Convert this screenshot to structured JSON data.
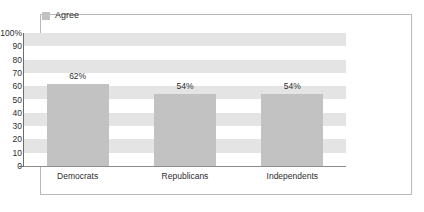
{
  "headline": {
    "text": "DATA: REGARDLESS OF PARTY AFFILIATION"
  },
  "legend": {
    "position": "top-left",
    "entries": [
      {
        "label": "Agree",
        "color": "#c2c2c2",
        "swatch_name": "legend-swatch-agree"
      }
    ]
  },
  "chart_data": {
    "type": "bar",
    "title": "",
    "xlabel": "",
    "ylabel": "",
    "categories": [
      "Democrats",
      "Republicans",
      "Independents"
    ],
    "series": [
      {
        "name": "Agree",
        "values": [
          62,
          54,
          54
        ],
        "color": "#c2c2c2"
      }
    ],
    "values": [
      62,
      54,
      54
    ],
    "value_labels": [
      "62%",
      "54%",
      "54%"
    ],
    "ylim": [
      0,
      100
    ],
    "ytick_step": 10,
    "ytick_labels": [
      "100%",
      "90",
      "80",
      "70",
      "60",
      "50",
      "40",
      "30",
      "20",
      "10",
      "0"
    ],
    "ytick_values": [
      100,
      90,
      80,
      70,
      60,
      50,
      40,
      30,
      20,
      10,
      0
    ],
    "grid": "alternating-horizontal-bands",
    "band_color": "#e4e4e4",
    "plot_background": "#ffffff",
    "legend_position": "top-left"
  },
  "frame": {
    "border_color": "#b9b9b9",
    "axis_color": "#6d6d6d"
  }
}
